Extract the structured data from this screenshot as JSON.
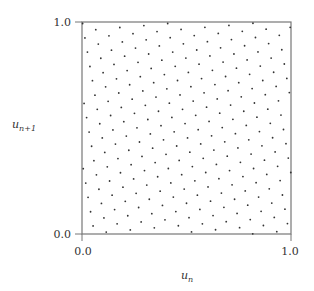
{
  "chart_data": {
    "type": "scatter",
    "title": "",
    "xlabel": "u",
    "xlabel_sub": "n",
    "ylabel": "u",
    "ylabel_sub": "n+1",
    "xlim": [
      0.0,
      1.0
    ],
    "ylim": [
      0.0,
      1.0
    ],
    "grid": false,
    "legend": "none",
    "x_ticks": [
      "0.0",
      "1.0"
    ],
    "y_ticks": [
      "0.0",
      "1.0"
    ],
    "colors": {
      "points": "#333333",
      "frame": "#777777",
      "text": "#333333"
    },
    "points": [
      [
        0.003,
        0.993
      ],
      [
        0.066,
        0.964
      ],
      [
        0.181,
        0.974
      ],
      [
        0.296,
        0.983
      ],
      [
        0.41,
        0.993
      ],
      [
        0.014,
        0.925
      ],
      [
        0.129,
        0.935
      ],
      [
        0.244,
        0.945
      ],
      [
        0.359,
        0.955
      ],
      [
        0.474,
        0.965
      ],
      [
        0.588,
        0.975
      ],
      [
        0.703,
        0.984
      ],
      [
        0.818,
        0.994
      ],
      [
        0.078,
        0.896
      ],
      [
        0.193,
        0.906
      ],
      [
        0.307,
        0.916
      ],
      [
        0.422,
        0.926
      ],
      [
        0.537,
        0.936
      ],
      [
        0.652,
        0.946
      ],
      [
        0.767,
        0.956
      ],
      [
        0.881,
        0.966
      ],
      [
        0.996,
        0.975
      ],
      [
        0.026,
        0.858
      ],
      [
        0.141,
        0.867
      ],
      [
        0.256,
        0.877
      ],
      [
        0.37,
        0.887
      ],
      [
        0.485,
        0.897
      ],
      [
        0.6,
        0.907
      ],
      [
        0.715,
        0.917
      ],
      [
        0.83,
        0.927
      ],
      [
        0.944,
        0.937
      ],
      [
        0.09,
        0.829
      ],
      [
        0.204,
        0.839
      ],
      [
        0.319,
        0.849
      ],
      [
        0.434,
        0.858
      ],
      [
        0.549,
        0.868
      ],
      [
        0.663,
        0.878
      ],
      [
        0.778,
        0.888
      ],
      [
        0.893,
        0.898
      ],
      [
        0.038,
        0.79
      ],
      [
        0.153,
        0.8
      ],
      [
        0.268,
        0.81
      ],
      [
        0.382,
        0.82
      ],
      [
        0.497,
        0.83
      ],
      [
        0.612,
        0.84
      ],
      [
        0.727,
        0.849
      ],
      [
        0.842,
        0.859
      ],
      [
        0.956,
        0.869
      ],
      [
        0.101,
        0.761
      ],
      [
        0.216,
        0.771
      ],
      [
        0.331,
        0.781
      ],
      [
        0.446,
        0.791
      ],
      [
        0.56,
        0.801
      ],
      [
        0.675,
        0.811
      ],
      [
        0.79,
        0.821
      ],
      [
        0.905,
        0.83
      ],
      [
        0.05,
        0.723
      ],
      [
        0.165,
        0.732
      ],
      [
        0.279,
        0.742
      ],
      [
        0.394,
        0.752
      ],
      [
        0.509,
        0.762
      ],
      [
        0.624,
        0.772
      ],
      [
        0.739,
        0.782
      ],
      [
        0.853,
        0.792
      ],
      [
        0.968,
        0.802
      ],
      [
        0.113,
        0.694
      ],
      [
        0.228,
        0.704
      ],
      [
        0.343,
        0.714
      ],
      [
        0.457,
        0.724
      ],
      [
        0.572,
        0.733
      ],
      [
        0.687,
        0.743
      ],
      [
        0.802,
        0.753
      ],
      [
        0.917,
        0.763
      ],
      [
        0.062,
        0.655
      ],
      [
        0.176,
        0.665
      ],
      [
        0.291,
        0.675
      ],
      [
        0.406,
        0.685
      ],
      [
        0.521,
        0.695
      ],
      [
        0.636,
        0.705
      ],
      [
        0.75,
        0.714
      ],
      [
        0.865,
        0.724
      ],
      [
        0.98,
        0.734
      ],
      [
        0.01,
        0.616
      ],
      [
        0.125,
        0.626
      ],
      [
        0.24,
        0.636
      ],
      [
        0.354,
        0.646
      ],
      [
        0.469,
        0.656
      ],
      [
        0.584,
        0.666
      ],
      [
        0.699,
        0.676
      ],
      [
        0.814,
        0.686
      ],
      [
        0.929,
        0.696
      ],
      [
        0.073,
        0.588
      ],
      [
        0.188,
        0.597
      ],
      [
        0.303,
        0.607
      ],
      [
        0.418,
        0.617
      ],
      [
        0.532,
        0.627
      ],
      [
        0.647,
        0.637
      ],
      [
        0.762,
        0.647
      ],
      [
        0.877,
        0.657
      ],
      [
        0.992,
        0.667
      ],
      [
        0.022,
        0.549
      ],
      [
        0.137,
        0.559
      ],
      [
        0.251,
        0.569
      ],
      [
        0.366,
        0.579
      ],
      [
        0.481,
        0.588
      ],
      [
        0.596,
        0.598
      ],
      [
        0.711,
        0.608
      ],
      [
        0.825,
        0.618
      ],
      [
        0.94,
        0.628
      ],
      [
        0.085,
        0.52
      ],
      [
        0.2,
        0.53
      ],
      [
        0.315,
        0.54
      ],
      [
        0.43,
        0.55
      ],
      [
        0.544,
        0.56
      ],
      [
        0.659,
        0.57
      ],
      [
        0.774,
        0.579
      ],
      [
        0.889,
        0.589
      ],
      [
        0.034,
        0.481
      ],
      [
        0.148,
        0.491
      ],
      [
        0.263,
        0.501
      ],
      [
        0.378,
        0.511
      ],
      [
        0.493,
        0.521
      ],
      [
        0.608,
        0.531
      ],
      [
        0.722,
        0.541
      ],
      [
        0.837,
        0.551
      ],
      [
        0.952,
        0.561
      ],
      [
        0.097,
        0.453
      ],
      [
        0.212,
        0.462
      ],
      [
        0.327,
        0.472
      ],
      [
        0.441,
        0.482
      ],
      [
        0.556,
        0.492
      ],
      [
        0.671,
        0.502
      ],
      [
        0.786,
        0.512
      ],
      [
        0.901,
        0.522
      ],
      [
        0.046,
        0.414
      ],
      [
        0.16,
        0.424
      ],
      [
        0.275,
        0.434
      ],
      [
        0.39,
        0.444
      ],
      [
        0.505,
        0.453
      ],
      [
        0.62,
        0.463
      ],
      [
        0.734,
        0.473
      ],
      [
        0.849,
        0.483
      ],
      [
        0.964,
        0.493
      ],
      [
        0.109,
        0.385
      ],
      [
        0.224,
        0.395
      ],
      [
        0.338,
        0.405
      ],
      [
        0.453,
        0.415
      ],
      [
        0.568,
        0.425
      ],
      [
        0.683,
        0.435
      ],
      [
        0.798,
        0.444
      ],
      [
        0.912,
        0.454
      ],
      [
        0.057,
        0.346
      ],
      [
        0.172,
        0.356
      ],
      [
        0.287,
        0.366
      ],
      [
        0.402,
        0.376
      ],
      [
        0.516,
        0.386
      ],
      [
        0.631,
        0.396
      ],
      [
        0.746,
        0.406
      ],
      [
        0.861,
        0.416
      ],
      [
        0.976,
        0.426
      ],
      [
        0.006,
        0.308
      ],
      [
        0.121,
        0.317
      ],
      [
        0.235,
        0.327
      ],
      [
        0.35,
        0.337
      ],
      [
        0.465,
        0.347
      ],
      [
        0.58,
        0.357
      ],
      [
        0.695,
        0.367
      ],
      [
        0.809,
        0.377
      ],
      [
        0.924,
        0.387
      ],
      [
        0.069,
        0.279
      ],
      [
        0.184,
        0.289
      ],
      [
        0.299,
        0.299
      ],
      [
        0.413,
        0.309
      ],
      [
        0.528,
        0.318
      ],
      [
        0.643,
        0.328
      ],
      [
        0.758,
        0.338
      ],
      [
        0.873,
        0.348
      ],
      [
        0.987,
        0.358
      ],
      [
        0.018,
        0.24
      ],
      [
        0.132,
        0.25
      ],
      [
        0.247,
        0.26
      ],
      [
        0.362,
        0.27
      ],
      [
        0.477,
        0.28
      ],
      [
        0.592,
        0.29
      ],
      [
        0.706,
        0.299
      ],
      [
        0.821,
        0.309
      ],
      [
        0.936,
        0.319
      ],
      [
        0.081,
        0.211
      ],
      [
        0.196,
        0.221
      ],
      [
        0.31,
        0.231
      ],
      [
        0.425,
        0.241
      ],
      [
        0.54,
        0.251
      ],
      [
        0.655,
        0.261
      ],
      [
        0.77,
        0.271
      ],
      [
        0.884,
        0.281
      ],
      [
        0.999,
        0.29
      ],
      [
        0.029,
        0.173
      ],
      [
        0.144,
        0.183
      ],
      [
        0.259,
        0.192
      ],
      [
        0.374,
        0.202
      ],
      [
        0.489,
        0.212
      ],
      [
        0.603,
        0.222
      ],
      [
        0.718,
        0.232
      ],
      [
        0.833,
        0.242
      ],
      [
        0.948,
        0.252
      ],
      [
        0.093,
        0.144
      ],
      [
        0.207,
        0.154
      ],
      [
        0.322,
        0.164
      ],
      [
        0.437,
        0.174
      ],
      [
        0.552,
        0.183
      ],
      [
        0.667,
        0.193
      ],
      [
        0.781,
        0.203
      ],
      [
        0.896,
        0.213
      ],
      [
        0.041,
        0.105
      ],
      [
        0.156,
        0.115
      ],
      [
        0.271,
        0.125
      ],
      [
        0.385,
        0.135
      ],
      [
        0.5,
        0.145
      ],
      [
        0.615,
        0.155
      ],
      [
        0.73,
        0.164
      ],
      [
        0.845,
        0.174
      ],
      [
        0.959,
        0.184
      ],
      [
        0.105,
        0.076
      ],
      [
        0.219,
        0.086
      ],
      [
        0.334,
        0.096
      ],
      [
        0.449,
        0.106
      ],
      [
        0.564,
        0.116
      ],
      [
        0.679,
        0.126
      ],
      [
        0.793,
        0.136
      ],
      [
        0.908,
        0.146
      ],
      [
        0.053,
        0.038
      ],
      [
        0.168,
        0.048
      ],
      [
        0.283,
        0.057
      ],
      [
        0.397,
        0.067
      ],
      [
        0.512,
        0.077
      ],
      [
        0.627,
        0.087
      ],
      [
        0.742,
        0.097
      ],
      [
        0.857,
        0.107
      ],
      [
        0.971,
        0.117
      ],
      [
        0.116,
        0.009
      ],
      [
        0.231,
        0.019
      ],
      [
        0.346,
        0.029
      ],
      [
        0.461,
        0.039
      ],
      [
        0.576,
        0.048
      ],
      [
        0.69,
        0.058
      ],
      [
        0.805,
        0.068
      ],
      [
        0.92,
        0.078
      ],
      [
        0.524,
        0.01
      ],
      [
        0.639,
        0.02
      ],
      [
        0.754,
        0.03
      ],
      [
        0.868,
        0.04
      ],
      [
        0.983,
        0.049
      ],
      [
        0.817,
        0.001
      ],
      [
        0.932,
        0.011
      ]
    ]
  }
}
